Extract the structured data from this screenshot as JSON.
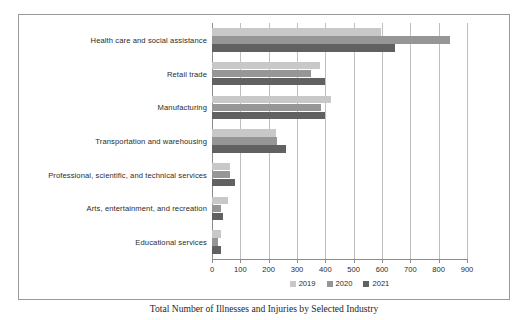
{
  "chart_data": {
    "type": "bar",
    "orientation": "horizontal",
    "title": "",
    "xlabel": "",
    "ylabel": "",
    "xlim": [
      0,
      900
    ],
    "xticks": [
      0,
      100,
      200,
      300,
      400,
      500,
      600,
      700,
      800,
      900
    ],
    "grid": true,
    "legend_position": "bottom-center",
    "categories": [
      "Health care and social assistance",
      "Retail trade",
      "Manufacturing",
      "Transportation and warehousing",
      "Professional, scientific, and technical services",
      "Arts, entertainment, and recreation",
      "Educational services"
    ],
    "series": [
      {
        "name": "2019",
        "color": "#c8c8c8",
        "values": [
          595,
          380,
          420,
          225,
          65,
          55,
          30
        ]
      },
      {
        "name": "2020",
        "color": "#969696",
        "values": [
          840,
          350,
          385,
          230,
          62,
          30,
          22
        ]
      },
      {
        "name": "2021",
        "color": "#616161",
        "values": [
          645,
          400,
          400,
          260,
          80,
          38,
          30
        ]
      }
    ]
  },
  "legend": {
    "items": [
      {
        "label": "2019"
      },
      {
        "label": "2020"
      },
      {
        "label": "2021"
      }
    ]
  },
  "caption": {
    "text": "Total Number of Illnesses and Injuries by Selected Industry"
  }
}
